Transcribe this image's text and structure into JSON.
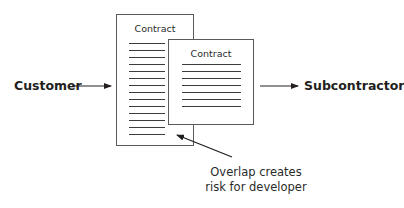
{
  "diagram": {
    "left_party": "Customer",
    "right_party": "Subcontractor",
    "documents": [
      {
        "id": "customer-contract",
        "title": "Contract",
        "line_count": 14
      },
      {
        "id": "subcontract",
        "title": "Contract",
        "line_count": 7
      }
    ],
    "annotation": {
      "line1": "Overlap creates",
      "line2": "risk for developer"
    },
    "colors": {
      "stroke": "#231f20",
      "border": "#5a5a5a",
      "background": "#ffffff"
    }
  }
}
